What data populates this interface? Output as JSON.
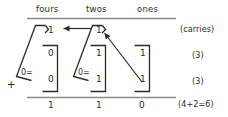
{
  "diagram": {
    "title_row": {
      "columns": [
        {
          "name": "fours",
          "label": "fours"
        },
        {
          "name": "twos",
          "label": "twos"
        },
        {
          "name": "ones",
          "label": "ones"
        }
      ]
    },
    "carry_row": {
      "annotation": "(carries)",
      "fours_value": "1",
      "twos_value": "1",
      "ones_value": ""
    },
    "addend_rows": [
      {
        "annotation": "(3)",
        "fours_value": "0",
        "twos_value": "1",
        "ones_value": "1"
      },
      {
        "annotation": "(3)",
        "fours_value": "0",
        "twos_value": "1",
        "ones_value": "1"
      }
    ],
    "sum_row": {
      "annotation": "(4+2=6)",
      "fours_value": "1",
      "twos_value": "1",
      "ones_value": "0"
    },
    "operator": "+",
    "group_markers": [
      {
        "column": "fours",
        "label": "0="
      },
      {
        "column": "twos",
        "label": "0="
      }
    ],
    "colors": {
      "ink": "#2b2b2b",
      "rule": "#8a8a8a",
      "background": "#ffffff"
    }
  }
}
